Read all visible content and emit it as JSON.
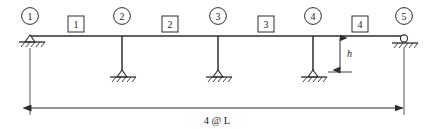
{
  "diagram": {
    "colors": {
      "line": "#2e2e2e",
      "background": "#ffffff",
      "text": "#1a1a1a"
    },
    "nodes": [
      {
        "label": "1",
        "x": 30,
        "support": "pin"
      },
      {
        "label": "2",
        "x": 122,
        "support": "pin-column-base"
      },
      {
        "label": "3",
        "x": 218,
        "support": "pin-column-base"
      },
      {
        "label": "4",
        "x": 313,
        "support": "pin-column-base"
      },
      {
        "label": "5",
        "x": 404,
        "support": "roller"
      }
    ],
    "members": [
      {
        "label": "1",
        "x": 76
      },
      {
        "label": "2",
        "x": 170
      },
      {
        "label": "3",
        "x": 266
      },
      {
        "label": "4",
        "x": 360
      }
    ],
    "dimensions": {
      "height_label": "h",
      "span_label": "4 @ L"
    },
    "geometry": {
      "beam_y": 36,
      "base_y": 79,
      "dim_y": 108,
      "node_circle_y": 16,
      "member_box_y": 24,
      "h_dim_x": 340
    }
  }
}
